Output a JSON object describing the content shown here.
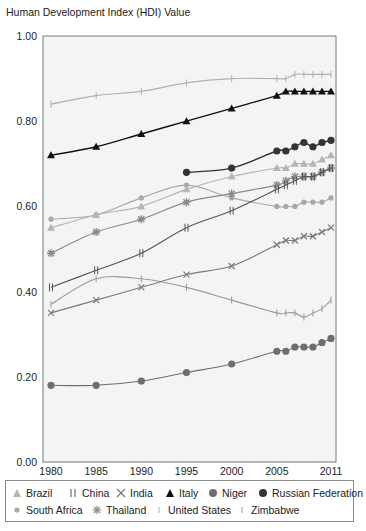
{
  "y_axis_title": "Human Development Index (HDI) Value",
  "chart_data": {
    "type": "line",
    "title": "",
    "xlabel": "",
    "ylabel": "Human Development Index (HDI) Value",
    "ylim": [
      0.0,
      1.0
    ],
    "y_ticks": [
      "0.00",
      "0.20",
      "0.40",
      "0.60",
      "0.80",
      "1.00"
    ],
    "x_ticks": [
      "1980",
      "1985",
      "1990",
      "1995",
      "2000",
      "2005",
      "2011"
    ],
    "grid": false,
    "legend_position": "bottom",
    "x": [
      1980,
      1985,
      1990,
      1995,
      2000,
      2005,
      2006,
      2007,
      2008,
      2009,
      2010,
      2011
    ],
    "series": [
      {
        "name": "Brazil",
        "marker": "triangle",
        "color": "#b5b5b5",
        "values": [
          0.55,
          0.58,
          0.6,
          0.64,
          0.67,
          0.69,
          0.69,
          0.7,
          0.7,
          0.7,
          0.71,
          0.72
        ]
      },
      {
        "name": "China",
        "marker": "double-bar",
        "color": "#555555",
        "values": [
          0.41,
          0.45,
          0.49,
          0.55,
          0.59,
          0.64,
          0.65,
          0.66,
          0.67,
          0.67,
          0.68,
          0.69
        ]
      },
      {
        "name": "India",
        "marker": "x",
        "color": "#7a7a7a",
        "values": [
          0.35,
          0.38,
          0.41,
          0.44,
          0.46,
          0.51,
          0.52,
          0.52,
          0.53,
          0.53,
          0.54,
          0.55
        ]
      },
      {
        "name": "Italy",
        "marker": "triangle",
        "color": "#111111",
        "values": [
          0.72,
          0.74,
          0.77,
          0.8,
          0.83,
          0.86,
          0.87,
          0.87,
          0.87,
          0.87,
          0.87,
          0.87
        ]
      },
      {
        "name": "Niger",
        "marker": "circle",
        "color": "#6e6e6e",
        "values": [
          0.18,
          0.18,
          0.19,
          0.21,
          0.23,
          0.26,
          0.26,
          0.27,
          0.27,
          0.27,
          0.28,
          0.29
        ]
      },
      {
        "name": "Russian Federation",
        "marker": "circle",
        "color": "#333333",
        "values": [
          null,
          null,
          null,
          0.68,
          0.69,
          0.73,
          0.73,
          0.74,
          0.75,
          0.74,
          0.75,
          0.755
        ]
      },
      {
        "name": "South Africa",
        "marker": "circle-small",
        "color": "#a8a8a8",
        "values": [
          0.57,
          0.58,
          0.62,
          0.65,
          0.62,
          0.6,
          0.6,
          0.6,
          0.61,
          0.61,
          0.61,
          0.62
        ]
      },
      {
        "name": "Thailand",
        "marker": "asterisk",
        "color": "#8a8a8a",
        "values": [
          0.49,
          0.54,
          0.57,
          0.61,
          0.63,
          0.65,
          0.66,
          0.67,
          0.67,
          0.67,
          0.68,
          0.69
        ]
      },
      {
        "name": "United States",
        "marker": "bar",
        "color": "#b0b0b0",
        "values": [
          0.84,
          0.86,
          0.87,
          0.89,
          0.9,
          0.9,
          0.9,
          0.91,
          0.91,
          0.91,
          0.91,
          0.91
        ]
      },
      {
        "name": "Zimbabwe",
        "marker": "bar",
        "color": "#9a9a9a",
        "values": [
          0.37,
          0.43,
          0.43,
          0.41,
          0.38,
          0.35,
          0.35,
          0.35,
          0.34,
          0.35,
          0.36,
          0.38
        ]
      }
    ]
  },
  "legend": {
    "items": [
      {
        "label": "Brazil"
      },
      {
        "label": "China"
      },
      {
        "label": "India"
      },
      {
        "label": "Italy"
      },
      {
        "label": "Niger"
      },
      {
        "label": "Russian Federation"
      },
      {
        "label": "South Africa"
      },
      {
        "label": "Thailand"
      },
      {
        "label": "United States"
      },
      {
        "label": "Zimbabwe"
      }
    ]
  }
}
